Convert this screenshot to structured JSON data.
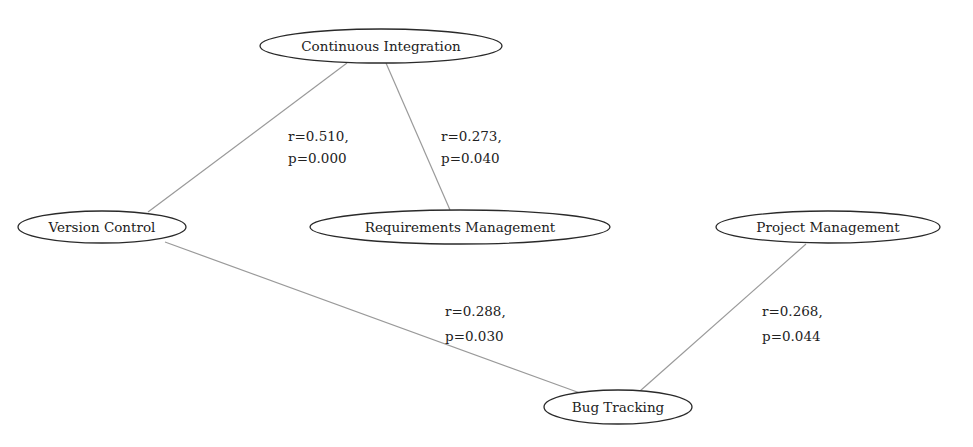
{
  "diagram": {
    "type": "correlation-graph",
    "nodes": [
      {
        "id": "ci",
        "label": "Continuous Integration"
      },
      {
        "id": "vc",
        "label": "Version Control"
      },
      {
        "id": "rm",
        "label": "Requirements Management"
      },
      {
        "id": "pm",
        "label": "Project Management"
      },
      {
        "id": "bt",
        "label": "Bug Tracking"
      }
    ],
    "edges": [
      {
        "id": "ci-vc",
        "from": "ci",
        "to": "vc",
        "r_label": "r=0.510,",
        "p_label": "p=0.000",
        "r": 0.51,
        "p": 0.0
      },
      {
        "id": "ci-rm",
        "from": "ci",
        "to": "rm",
        "r_label": "r=0.273,",
        "p_label": "p=0.040",
        "r": 0.273,
        "p": 0.04
      },
      {
        "id": "vc-bt",
        "from": "vc",
        "to": "bt",
        "r_label": "r=0.288,",
        "p_label": "p=0.030",
        "r": 0.288,
        "p": 0.03
      },
      {
        "id": "pm-bt",
        "from": "pm",
        "to": "bt",
        "r_label": "r=0.268,",
        "p_label": "p=0.044",
        "r": 0.268,
        "p": 0.044
      }
    ],
    "colors": {
      "edge": "#9a9a9a",
      "node_border": "#2a2a2a",
      "text": "#222222",
      "background": "#ffffff"
    }
  }
}
